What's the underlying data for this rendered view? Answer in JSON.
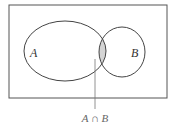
{
  "diagram": {
    "type": "venn",
    "sets": [
      {
        "label": "A"
      },
      {
        "label": "B"
      }
    ],
    "intersection_label": "A ∩ B",
    "colors": {
      "stroke": "#555555",
      "intersection_fill": "#d4d4d4",
      "background": "#ffffff"
    }
  }
}
